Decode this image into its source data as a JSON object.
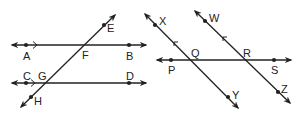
{
  "figures": [
    {
      "name": "left-figure",
      "lines": [
        {
          "id": "AB",
          "x1": 12,
          "y1": 45,
          "x2": 146,
          "y2": 45,
          "arrows": "both"
        },
        {
          "id": "CD",
          "x1": 12,
          "y1": 83,
          "x2": 146,
          "y2": 83,
          "arrows": "both"
        },
        {
          "id": "EH",
          "x1": 115,
          "y1": 15,
          "x2": 21,
          "y2": 107,
          "arrows": "both"
        }
      ],
      "parallel_marks": [
        {
          "on": "AB",
          "x": 36,
          "y": 45,
          "dir": "right"
        },
        {
          "on": "CD",
          "x": 34,
          "y": 83,
          "dir": "right"
        }
      ],
      "points": [
        {
          "label": "A",
          "x": 26,
          "y": 45,
          "lx": 23,
          "ly": 60,
          "dot": true
        },
        {
          "label": "B",
          "x": 129,
          "y": 45,
          "lx": 126,
          "ly": 60,
          "dot": true
        },
        {
          "label": "C",
          "x": 26,
          "y": 83,
          "lx": 23,
          "ly": 80,
          "dot": true
        },
        {
          "label": "D",
          "x": 129,
          "y": 83,
          "lx": 126,
          "ly": 80,
          "dot": true
        },
        {
          "label": "E",
          "x": 104,
          "y": 25,
          "lx": 107,
          "ly": 32,
          "dot": true
        },
        {
          "label": "F",
          "x": 84,
          "y": 45,
          "lx": 82,
          "ly": 59,
          "dot": false
        },
        {
          "label": "G",
          "x": 44,
          "y": 83,
          "lx": 38,
          "ly": 80,
          "dot": false
        },
        {
          "label": "H",
          "x": 31,
          "y": 97,
          "lx": 34,
          "ly": 105,
          "dot": true
        }
      ]
    },
    {
      "name": "right-figure",
      "lines": [
        {
          "id": "PS",
          "x1": 157,
          "y1": 60,
          "x2": 291,
          "y2": 60,
          "arrows": "both"
        },
        {
          "id": "XY",
          "x1": 145,
          "y1": 14,
          "x2": 238,
          "y2": 108,
          "arrows": "both"
        },
        {
          "id": "WZ",
          "x1": 195,
          "y1": 11,
          "x2": 290,
          "y2": 103,
          "arrows": "both"
        }
      ],
      "parallel_marks": [
        {
          "on": "XY",
          "x": 175,
          "y": 45,
          "dir": "up-left"
        },
        {
          "on": "WZ",
          "x": 224,
          "y": 40,
          "dir": "up-left"
        }
      ],
      "points": [
        {
          "label": "X",
          "x": 155,
          "y": 25,
          "lx": 159,
          "ly": 25,
          "dot": true
        },
        {
          "label": "Y",
          "x": 228,
          "y": 97,
          "lx": 232,
          "ly": 99,
          "dot": true
        },
        {
          "label": "W",
          "x": 205,
          "y": 21,
          "lx": 209,
          "ly": 22,
          "dot": true
        },
        {
          "label": "Z",
          "x": 278,
          "y": 92,
          "lx": 281,
          "ly": 93,
          "dot": true
        },
        {
          "label": "P",
          "x": 171,
          "y": 60,
          "lx": 168,
          "ly": 74,
          "dot": true
        },
        {
          "label": "Q",
          "x": 190,
          "y": 60,
          "lx": 191,
          "ly": 57,
          "dot": false
        },
        {
          "label": "R",
          "x": 244,
          "y": 60,
          "lx": 243,
          "ly": 57,
          "dot": false
        },
        {
          "label": "S",
          "x": 274,
          "y": 60,
          "lx": 271,
          "ly": 74,
          "dot": true
        }
      ]
    }
  ],
  "colors": {
    "line": "#222222",
    "background": "#ffffff"
  }
}
